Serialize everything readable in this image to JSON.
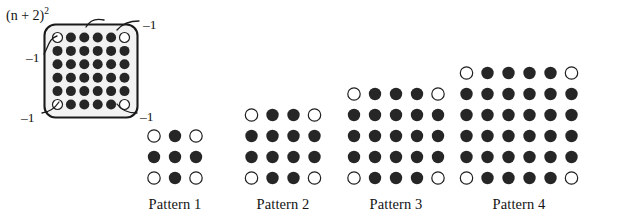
{
  "figure": {
    "background_color": "#ffffff",
    "dot_filled_color": "#262626",
    "dot_open_color": "#ffffff",
    "dot_stroke_color": "#1f1f1f",
    "outline_color": "#1a1a1a",
    "outline_fill_color": "#f2f2f2",
    "leader_color": "#1a1a1a"
  },
  "annotated_grid": {
    "name": "annotated-square-grid",
    "rows": 6,
    "cols": 6,
    "total_dots": 36,
    "filled_dots": 32,
    "open_dots": 4,
    "open_dot_positions": [
      [
        0,
        0
      ],
      [
        0,
        5
      ],
      [
        5,
        0
      ],
      [
        5,
        5
      ]
    ],
    "formula_label": "(n + 2)",
    "formula_exponent": "2",
    "formula_variable": "n",
    "callouts": [
      {
        "id": "callout-top-right",
        "label": "–1"
      },
      {
        "id": "callout-left",
        "label": "–1"
      },
      {
        "id": "callout-bottom-left",
        "label": "–1"
      },
      {
        "id": "callout-bottom-right",
        "label": "–1"
      }
    ]
  },
  "patterns": [
    {
      "id": "pattern-1",
      "label": "Pattern 1",
      "rows": 3,
      "cols": 3,
      "total_dots": 9,
      "filled_dots": 5,
      "open_dots": 4,
      "open_dot_positions": [
        [
          0,
          0
        ],
        [
          0,
          2
        ],
        [
          2,
          0
        ],
        [
          2,
          2
        ]
      ]
    },
    {
      "id": "pattern-2",
      "label": "Pattern 2",
      "rows": 4,
      "cols": 4,
      "total_dots": 16,
      "filled_dots": 12,
      "open_dots": 4,
      "open_dot_positions": [
        [
          0,
          0
        ],
        [
          0,
          3
        ],
        [
          3,
          0
        ],
        [
          3,
          3
        ]
      ]
    },
    {
      "id": "pattern-3",
      "label": "Pattern 3",
      "rows": 5,
      "cols": 5,
      "total_dots": 25,
      "filled_dots": 21,
      "open_dots": 4,
      "open_dot_positions": [
        [
          0,
          0
        ],
        [
          0,
          4
        ],
        [
          4,
          0
        ],
        [
          4,
          4
        ]
      ]
    },
    {
      "id": "pattern-4",
      "label": "Pattern 4",
      "rows": 6,
      "cols": 6,
      "total_dots": 36,
      "filled_dots": 32,
      "open_dots": 4,
      "open_dot_positions": [
        [
          0,
          0
        ],
        [
          0,
          5
        ],
        [
          5,
          0
        ],
        [
          5,
          5
        ]
      ]
    }
  ]
}
